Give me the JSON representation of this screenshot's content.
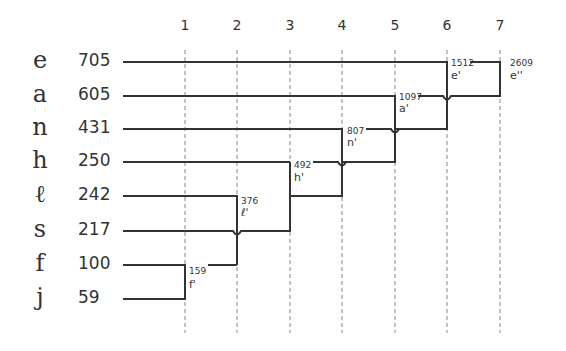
{
  "columns": [
    "1",
    "2",
    "3",
    "4",
    "5",
    "6",
    "7"
  ],
  "rows": [
    {
      "letter": "e",
      "freq": "705"
    },
    {
      "letter": "a",
      "freq": "605"
    },
    {
      "letter": "n",
      "freq": "431"
    },
    {
      "letter": "h",
      "freq": "250"
    },
    {
      "letter": "ℓ",
      "freq": "242"
    },
    {
      "letter": "s",
      "freq": "217"
    },
    {
      "letter": "f",
      "freq": "100"
    },
    {
      "letter": "j",
      "freq": "59"
    }
  ],
  "merges": [
    {
      "step": "1",
      "value": "159",
      "name": "f'",
      "joins": [
        "f",
        "j"
      ]
    },
    {
      "step": "2",
      "value": "376",
      "name": "ℓ'",
      "joins": [
        "ℓ",
        "f'"
      ]
    },
    {
      "step": "3",
      "value": "492",
      "name": "h'",
      "joins": [
        "h",
        "s + ℓ'"
      ]
    },
    {
      "step": "4",
      "value": "807",
      "name": "n'",
      "joins": [
        "n",
        "h'"
      ]
    },
    {
      "step": "5",
      "value": "1097",
      "name": "a'",
      "joins": [
        "a",
        "n'"
      ]
    },
    {
      "step": "6",
      "value": "1512",
      "name": "e'",
      "joins": [
        "e",
        "a'"
      ]
    },
    {
      "step": "7",
      "value": "2609",
      "name": "e''",
      "joins": [
        "e'",
        "a'"
      ]
    }
  ],
  "colors": {
    "line": "#333333",
    "dash": "#888888",
    "background": "#ffffff"
  }
}
